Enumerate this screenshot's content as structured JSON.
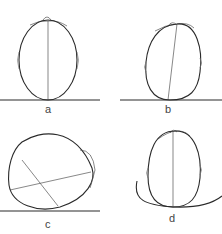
{
  "figure": {
    "panels": [
      {
        "id": "a",
        "label": "a",
        "description": "Head centered on flat ground, vertical midline"
      },
      {
        "id": "b",
        "label": "b",
        "description": "Head tilted slightly on flat ground"
      },
      {
        "id": "c",
        "label": "c",
        "description": "Head lying on its side with crossing axes"
      },
      {
        "id": "d",
        "label": "d",
        "description": "Head resting on curved surface, vertical midline"
      }
    ]
  }
}
